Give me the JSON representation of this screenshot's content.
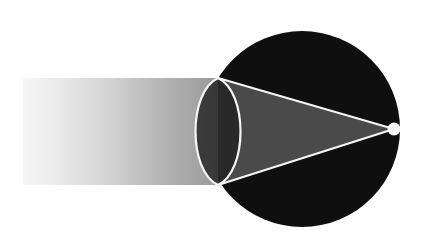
{
  "figure": {
    "type": "optical-ray-diagram",
    "canvas": {
      "width": 430,
      "height": 242,
      "background": "#ffffff"
    }
  },
  "colors": {
    "background": "#ffffff",
    "axis_line": "#8c8c8c",
    "beam_light": "#f2f2f2",
    "beam_mid": "#cfcfcf",
    "beam_dark": "#9a9a9a",
    "sphere_fill": "#100f0f",
    "wedge_fill": "#4a4a4a",
    "lens_fill": "#262626",
    "stroke_light": "#f5f5f5",
    "focal_dot": "#ffffff"
  },
  "elements": {
    "vertical_axis": {
      "label": "vertical reference line",
      "x": 22,
      "y_top": 0,
      "y_bottom": 242,
      "stroke_width": 1.6
    },
    "beam_band": {
      "label": "incoming light beam",
      "x_start": 23,
      "x_end": 222,
      "y_top": 78,
      "y_bottom": 185,
      "gradient_from": "#f4f4f4",
      "gradient_to": "#9b9b9b"
    },
    "sphere": {
      "label": "dark sphere",
      "cx": 302,
      "cy": 129,
      "r": 98,
      "fill": "#100f0f"
    },
    "lens": {
      "label": "biconvex lens (vesica)",
      "vertex_top_x": 218,
      "vertex_top_y": 78,
      "vertex_bottom_x": 218,
      "vertex_bottom_y": 185,
      "half_width": 30,
      "stroke": "#f5f5f5",
      "stroke_width": 2.2
    },
    "converging_wedge": {
      "label": "converging ray wedge",
      "apex_x": 394,
      "apex_y": 129,
      "base_top_x": 218,
      "base_top_y": 78,
      "base_bottom_x": 218,
      "base_bottom_y": 185,
      "fill": "#4a4a4a"
    },
    "ray_upper": {
      "label": "upper marginal ray",
      "x1": 218,
      "y1": 78,
      "x2": 394,
      "y2": 129,
      "stroke_width": 2.2
    },
    "ray_lower": {
      "label": "lower marginal ray",
      "x1": 218,
      "y1": 185,
      "x2": 394,
      "y2": 129,
      "stroke_width": 2.2
    },
    "focal_point": {
      "label": "focal point",
      "cx": 394,
      "cy": 129,
      "r": 6.5,
      "fill": "#ffffff"
    }
  }
}
